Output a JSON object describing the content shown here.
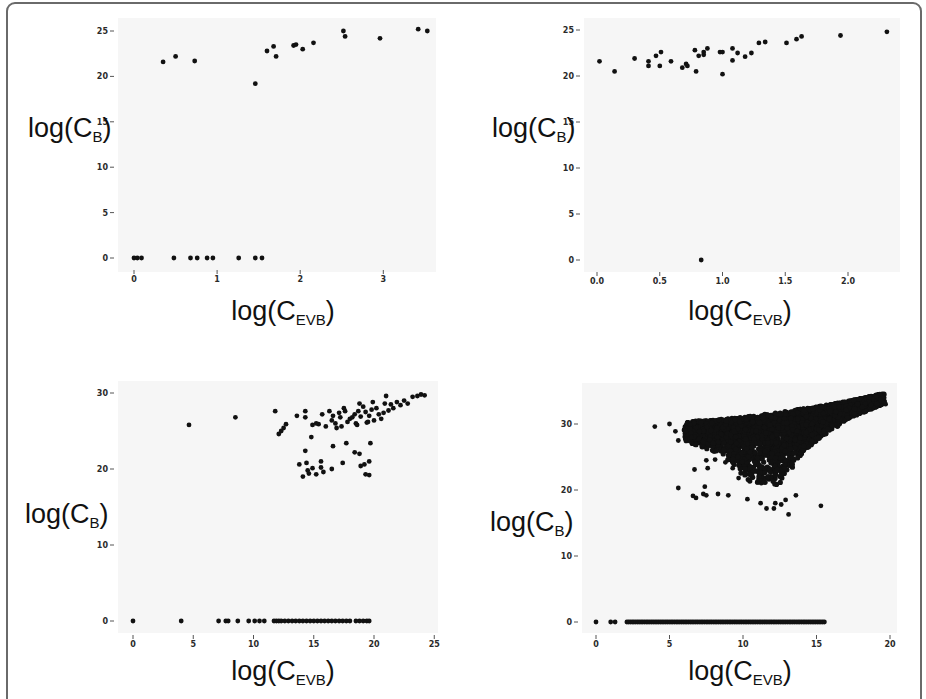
{
  "chart_data": [
    {
      "type": "scatter",
      "panel": "top-left",
      "title": "",
      "xlabel": "log(C_EVB)",
      "xlabel_main": "log(C",
      "xlabel_sub": "EVB",
      "xlabel_end": ")",
      "ylabel": "log(C_B)",
      "ylabel_main": "log(C",
      "ylabel_sub": "B",
      "ylabel_end": ")",
      "xlim": [
        -0.15,
        3.7
      ],
      "ylim": [
        -1.2,
        26.5
      ],
      "xticks": [
        0,
        1,
        2,
        3
      ],
      "xtick_labels": [
        "0",
        "1",
        "2",
        "3"
      ],
      "yticks": [
        0,
        5,
        10,
        15,
        20,
        25
      ],
      "ytick_labels": [
        "0",
        "5",
        "10",
        "15",
        "20",
        "25"
      ],
      "grid": false,
      "points": [
        [
          0.35,
          21.6
        ],
        [
          0.5,
          22.2
        ],
        [
          0.73,
          21.7
        ],
        [
          1.46,
          19.2
        ],
        [
          1.6,
          22.8
        ],
        [
          1.68,
          23.3
        ],
        [
          1.71,
          22.2
        ],
        [
          1.92,
          23.4
        ],
        [
          1.95,
          23.5
        ],
        [
          2.03,
          23.0
        ],
        [
          2.16,
          23.7
        ],
        [
          2.52,
          25.0
        ],
        [
          2.54,
          24.4
        ],
        [
          2.96,
          24.2
        ],
        [
          3.42,
          25.2
        ],
        [
          3.53,
          25.0
        ],
        [
          0.0,
          0
        ],
        [
          0.04,
          0
        ],
        [
          0.09,
          0
        ],
        [
          0.48,
          0
        ],
        [
          0.68,
          0
        ],
        [
          0.76,
          0
        ],
        [
          0.88,
          0
        ],
        [
          0.95,
          0
        ],
        [
          1.26,
          0
        ],
        [
          1.46,
          0
        ],
        [
          1.54,
          0
        ]
      ]
    },
    {
      "type": "scatter",
      "panel": "top-right",
      "title": "",
      "xlabel": "log(C_EVB)",
      "xlabel_main": "log(C",
      "xlabel_sub": "EVB",
      "xlabel_end": ")",
      "ylabel": "log(C_B)",
      "ylabel_main": "log(C",
      "ylabel_sub": "B",
      "ylabel_end": ")",
      "xlim": [
        -0.1,
        2.4
      ],
      "ylim": [
        -1.2,
        26.5
      ],
      "xticks": [
        0.0,
        0.5,
        1.0,
        1.5,
        2.0
      ],
      "xtick_labels": [
        "0.0",
        "0.5",
        "1.0",
        "1.5",
        "2.0"
      ],
      "yticks": [
        0,
        5,
        10,
        15,
        20,
        25
      ],
      "ytick_labels": [
        "0",
        "5",
        "10",
        "15",
        "20",
        "25"
      ],
      "grid": false,
      "points": [
        [
          0.02,
          21.6
        ],
        [
          0.14,
          20.5
        ],
        [
          0.3,
          21.9
        ],
        [
          0.41,
          21.6
        ],
        [
          0.41,
          21.1
        ],
        [
          0.47,
          22.2
        ],
        [
          0.51,
          22.6
        ],
        [
          0.5,
          21.1
        ],
        [
          0.59,
          21.6
        ],
        [
          0.68,
          20.9
        ],
        [
          0.71,
          21.3
        ],
        [
          0.72,
          21.1
        ],
        [
          0.78,
          22.8
        ],
        [
          0.79,
          20.5
        ],
        [
          0.81,
          22.2
        ],
        [
          0.85,
          22.6
        ],
        [
          0.85,
          22.3
        ],
        [
          0.88,
          23.0
        ],
        [
          0.98,
          22.6
        ],
        [
          1.0,
          20.2
        ],
        [
          1.0,
          22.6
        ],
        [
          1.08,
          23.0
        ],
        [
          1.08,
          21.7
        ],
        [
          1.12,
          22.5
        ],
        [
          1.18,
          22.1
        ],
        [
          1.23,
          22.5
        ],
        [
          1.29,
          23.6
        ],
        [
          1.34,
          23.7
        ],
        [
          1.51,
          23.6
        ],
        [
          1.59,
          24.0
        ],
        [
          1.63,
          24.3
        ],
        [
          1.94,
          24.4
        ],
        [
          2.31,
          24.8
        ],
        [
          0.83,
          0
        ]
      ]
    },
    {
      "type": "scatter",
      "panel": "bottom-left",
      "title": "",
      "xlabel": "log(C_EVB)",
      "xlabel_main": "log(C",
      "xlabel_sub": "EVB",
      "xlabel_end": ")",
      "ylabel": "log(C_B)",
      "ylabel_main": "log(C",
      "ylabel_sub": "B",
      "ylabel_end": ")",
      "xlim": [
        -1.2,
        25.5
      ],
      "ylim": [
        -1.5,
        31.5
      ],
      "xticks": [
        0,
        5,
        10,
        15,
        20,
        25
      ],
      "xtick_labels": [
        "0",
        "5",
        "10",
        "15",
        "20",
        "25"
      ],
      "yticks": [
        0,
        10,
        20,
        30
      ],
      "ytick_labels": [
        "0",
        "10",
        "20",
        "30"
      ],
      "grid": false,
      "points": [
        [
          4.65,
          25.8
        ],
        [
          8.5,
          26.8
        ],
        [
          11.8,
          27.6
        ],
        [
          12.1,
          24.6
        ],
        [
          12.3,
          25.0
        ],
        [
          12.5,
          25.4
        ],
        [
          12.7,
          25.9
        ],
        [
          13.6,
          27.0
        ],
        [
          14.3,
          27.6
        ],
        [
          14.3,
          26.8
        ],
        [
          14.8,
          24.2
        ],
        [
          14.9,
          25.8
        ],
        [
          15.4,
          25.9
        ],
        [
          15.7,
          27.2
        ],
        [
          16.3,
          27.6
        ],
        [
          16.5,
          26.4
        ],
        [
          16.6,
          27.0
        ],
        [
          16.8,
          26.0
        ],
        [
          16.9,
          25.4
        ],
        [
          17.1,
          27.4
        ],
        [
          17.3,
          25.6
        ],
        [
          17.6,
          27.6
        ],
        [
          17.8,
          26.2
        ],
        [
          18.0,
          26.6
        ],
        [
          18.2,
          26.8
        ],
        [
          18.4,
          27.2
        ],
        [
          18.5,
          26.0
        ],
        [
          18.7,
          27.6
        ],
        [
          18.9,
          26.9
        ],
        [
          19.1,
          28.2
        ],
        [
          19.3,
          27.5
        ],
        [
          19.4,
          26.1
        ],
        [
          19.6,
          27.0
        ],
        [
          19.8,
          27.8
        ],
        [
          20.0,
          26.4
        ],
        [
          20.2,
          28.0
        ],
        [
          20.4,
          27.2
        ],
        [
          20.6,
          26.6
        ],
        [
          20.8,
          27.4
        ],
        [
          21.0,
          29.6
        ],
        [
          21.2,
          27.7
        ],
        [
          21.4,
          28.5
        ],
        [
          21.6,
          28.0
        ],
        [
          21.9,
          28.8
        ],
        [
          22.2,
          28.4
        ],
        [
          22.5,
          29.0
        ],
        [
          22.8,
          28.6
        ],
        [
          23.2,
          29.5
        ],
        [
          23.6,
          29.6
        ],
        [
          23.9,
          29.8
        ],
        [
          24.2,
          29.7
        ],
        [
          17.5,
          28.0
        ],
        [
          18.8,
          28.6
        ],
        [
          19.9,
          28.8
        ],
        [
          20.9,
          28.6
        ],
        [
          15.2,
          26.0
        ],
        [
          16.0,
          25.6
        ],
        [
          17.2,
          26.8
        ],
        [
          18.6,
          25.8
        ],
        [
          19.5,
          26.2
        ],
        [
          14.3,
          22.4
        ],
        [
          13.8,
          20.6
        ],
        [
          14.1,
          19.0
        ],
        [
          14.4,
          20.8
        ],
        [
          14.6,
          19.4
        ],
        [
          14.9,
          20.1
        ],
        [
          15.2,
          19.3
        ],
        [
          15.6,
          20.2
        ],
        [
          15.8,
          19.6
        ],
        [
          16.5,
          20.0
        ],
        [
          16.6,
          23.0
        ],
        [
          17.4,
          20.8
        ],
        [
          17.7,
          23.4
        ],
        [
          18.4,
          22.2
        ],
        [
          18.8,
          22.0
        ],
        [
          18.9,
          20.4
        ],
        [
          19.2,
          20.6
        ],
        [
          19.3,
          19.3
        ],
        [
          19.6,
          19.2
        ],
        [
          19.7,
          23.4
        ],
        [
          19.6,
          21.0
        ],
        [
          15.6,
          21.0
        ],
        [
          14.5,
          19.8
        ],
        [
          0.0,
          0
        ],
        [
          4.0,
          0
        ],
        [
          7.1,
          0
        ],
        [
          7.7,
          0
        ],
        [
          7.9,
          0
        ],
        [
          8.7,
          0
        ],
        [
          9.6,
          0
        ],
        [
          10.1,
          0
        ],
        [
          10.5,
          0
        ],
        [
          10.9,
          0
        ],
        [
          11.7,
          0
        ],
        [
          11.9,
          0
        ],
        [
          12.1,
          0
        ],
        [
          12.3,
          0
        ],
        [
          12.6,
          0
        ],
        [
          12.9,
          0
        ],
        [
          13.2,
          0
        ],
        [
          13.5,
          0
        ],
        [
          13.8,
          0
        ],
        [
          14.1,
          0
        ],
        [
          14.4,
          0
        ],
        [
          14.7,
          0
        ],
        [
          15.0,
          0
        ],
        [
          15.3,
          0
        ],
        [
          15.6,
          0
        ],
        [
          15.9,
          0
        ],
        [
          16.2,
          0
        ],
        [
          16.5,
          0
        ],
        [
          16.8,
          0
        ],
        [
          17.1,
          0
        ],
        [
          17.4,
          0
        ],
        [
          17.7,
          0
        ],
        [
          18.0,
          0
        ],
        [
          18.5,
          0
        ],
        [
          18.8,
          0
        ],
        [
          19.1,
          0
        ],
        [
          19.4,
          0
        ],
        [
          19.6,
          0
        ]
      ]
    },
    {
      "type": "scatter",
      "panel": "bottom-right",
      "title": "",
      "xlabel": "log(C_EVB)",
      "xlabel_main": "log(C",
      "xlabel_sub": "EVB",
      "xlabel_end": ")",
      "ylabel": "log(C_B)",
      "ylabel_main": "log(C",
      "ylabel_sub": "B",
      "ylabel_end": ")",
      "xlim": [
        -1.0,
        20.3
      ],
      "ylim": [
        -1.5,
        35.5
      ],
      "xticks": [
        0,
        5,
        10,
        15,
        20
      ],
      "xtick_labels": [
        "0",
        "5",
        "10",
        "15",
        "20"
      ],
      "yticks": [
        0,
        10,
        20,
        30
      ],
      "ytick_labels": [
        "0",
        "10",
        "20",
        "30"
      ],
      "grid": false,
      "dense_region": {
        "description": "dense cluster of many thousands of points",
        "x_range": [
          6.0,
          19.6
        ],
        "upper_edge": [
          [
            6.0,
            30.3
          ],
          [
            9.0,
            30.8
          ],
          [
            12.0,
            31.6
          ],
          [
            15.0,
            32.6
          ],
          [
            17.5,
            33.6
          ],
          [
            19.5,
            34.6
          ]
        ],
        "lower_edge": [
          [
            6.0,
            27.4
          ],
          [
            8.5,
            25.5
          ],
          [
            10.5,
            21.0
          ],
          [
            12.5,
            20.6
          ],
          [
            14.0,
            25.4
          ],
          [
            15.0,
            27.5
          ],
          [
            17.0,
            30.5
          ],
          [
            19.5,
            33.0
          ]
        ],
        "zero_row_range": [
          2.1,
          15.6
        ]
      },
      "points": [
        [
          4.0,
          29.6
        ],
        [
          5.0,
          30.0
        ],
        [
          5.4,
          28.9
        ],
        [
          5.6,
          27.5
        ],
        [
          5.6,
          20.3
        ],
        [
          6.4,
          29.9
        ],
        [
          6.5,
          28.0
        ],
        [
          6.7,
          23.1
        ],
        [
          6.6,
          19.1
        ],
        [
          6.8,
          18.8
        ],
        [
          7.3,
          19.4
        ],
        [
          7.5,
          19.2
        ],
        [
          7.4,
          20.5
        ],
        [
          7.6,
          23.3
        ],
        [
          7.5,
          24.5
        ],
        [
          8.1,
          24.6
        ],
        [
          8.3,
          19.4
        ],
        [
          9.0,
          19.2
        ],
        [
          9.7,
          21.8
        ],
        [
          10.3,
          18.6
        ],
        [
          11.2,
          18.0
        ],
        [
          11.6,
          17.2
        ],
        [
          12.1,
          17.2
        ],
        [
          12.2,
          18.0
        ],
        [
          12.6,
          17.8
        ],
        [
          12.9,
          18.5
        ],
        [
          13.1,
          16.3
        ],
        [
          13.6,
          19.2
        ],
        [
          15.3,
          17.6
        ],
        [
          19.6,
          33.2
        ],
        [
          19.7,
          33.0
        ],
        [
          8.8,
          24.2
        ],
        [
          9.3,
          23.3
        ],
        [
          0.0,
          0
        ],
        [
          1.0,
          0
        ],
        [
          1.3,
          0
        ]
      ]
    }
  ]
}
